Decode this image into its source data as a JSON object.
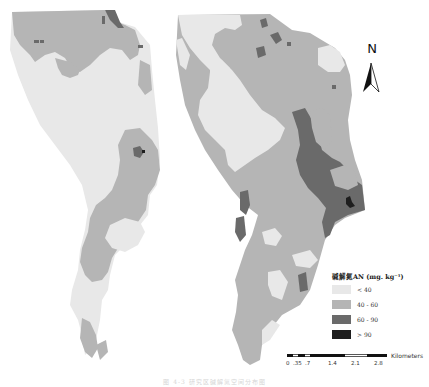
{
  "figure": {
    "caption": "图 4-3 研究区碱解氮空间分布图",
    "colors": {
      "class1": "#e8e8e8",
      "class2": "#b5b5b5",
      "class3": "#6a6a6a",
      "class4": "#1e1e1e",
      "background": "#ffffff"
    }
  },
  "legend": {
    "title": "碱解氮AN (mg. kg⁻¹)",
    "items": [
      {
        "label": "< 40",
        "color": "#e8e8e8"
      },
      {
        "label": "40 - 60",
        "color": "#b5b5b5"
      },
      {
        "label": "60 - 90",
        "color": "#6a6a6a"
      },
      {
        "label": "> 90",
        "color": "#1e1e1e"
      }
    ]
  },
  "north_arrow": {
    "letter": "N"
  },
  "scale_bar": {
    "unit": "Kilometers",
    "ticks": [
      "0",
      ".35",
      ".7",
      "1.4",
      "2.1",
      "2.8"
    ]
  }
}
